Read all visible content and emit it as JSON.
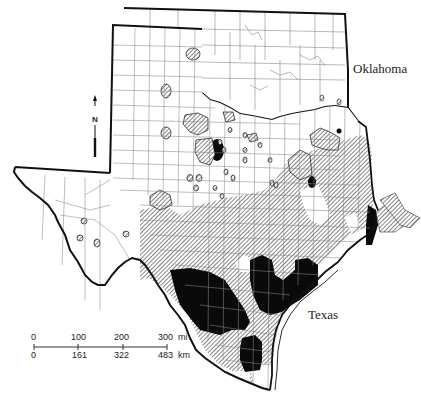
{
  "map": {
    "labels": {
      "oklahoma": "Oklahoma",
      "texas": "Texas"
    },
    "north_arrow": {
      "icon": "north-arrow-icon",
      "letter": "N"
    },
    "scale_bar": {
      "miles": {
        "ticks": [
          "0",
          "100",
          "200",
          "300"
        ],
        "unit": "mi"
      },
      "kilometers": {
        "ticks": [
          "0",
          "161",
          "322",
          "483"
        ],
        "unit": "km"
      }
    },
    "legend_styles": {
      "hatched_fill": "#ffffff",
      "hatch_stroke": "#333333",
      "solid_fill": "#0a0a0a",
      "border_color": "#111111",
      "county_line_color": "#777777"
    }
  }
}
